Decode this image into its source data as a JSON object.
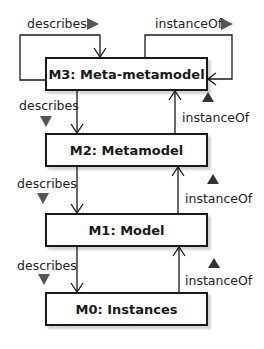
{
  "diagram": {
    "type": "metamodel-layer-hierarchy",
    "layers": [
      {
        "id": "M3",
        "label": "M3: Meta-metamodel"
      },
      {
        "id": "M2",
        "label": "M2: Metamodel"
      },
      {
        "id": "M1",
        "label": "M1: Model"
      },
      {
        "id": "M0",
        "label": "M0: Instances"
      }
    ],
    "edges": [
      {
        "from": "M3",
        "to": "M3",
        "label": "describes",
        "direction_marker": "right"
      },
      {
        "from": "M3",
        "to": "M3",
        "label": "instanceOf",
        "direction_marker": "right"
      },
      {
        "from": "M3",
        "to": "M2",
        "label": "describes",
        "direction_marker": "down"
      },
      {
        "from": "M2",
        "to": "M3",
        "label": "instanceOf",
        "direction_marker": "up"
      },
      {
        "from": "M2",
        "to": "M1",
        "label": "describes",
        "direction_marker": "down"
      },
      {
        "from": "M1",
        "to": "M2",
        "label": "instanceOf",
        "direction_marker": "up"
      },
      {
        "from": "M1",
        "to": "M0",
        "label": "describes",
        "direction_marker": "down"
      },
      {
        "from": "M0",
        "to": "M1",
        "label": "instanceOf",
        "direction_marker": "up"
      }
    ]
  },
  "colors": {
    "line": "#1a1a1a",
    "marker_down": "#555555",
    "marker_up": "#333333"
  }
}
